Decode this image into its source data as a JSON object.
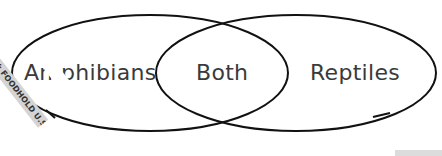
{
  "diagram": {
    "type": "venn",
    "sets": [
      {
        "label": "Amphibians",
        "visible_text": "Amphibians"
      },
      {
        "label": "Reptiles"
      }
    ],
    "intersection": {
      "label": "Both"
    },
    "stroke_color": "#111111",
    "text_color": "#3a3a3a"
  },
  "watermark": {
    "text": "UTED BY: FOODHOLD U.S.A, LLC"
  }
}
